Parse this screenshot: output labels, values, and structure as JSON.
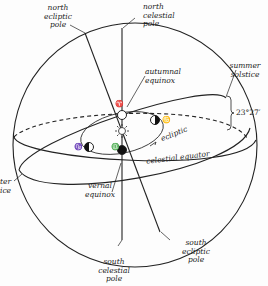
{
  "labels": {
    "north_ecliptic_pole": "north\necliptic\npole",
    "north_celestial_pole": "north\ncelestial\npole",
    "autumnal_equinox": "autumnal\nequinox",
    "summer_solstice": "summer\nsolstice",
    "obliquity": "23°27′",
    "ecliptic": "ecliptic",
    "celestial_equator": "celestial equator",
    "winter_solstice": "ter\nice",
    "vernal_equinox": "vernal\nequinox",
    "south_celestial_pole": "south\ncelestial\npole",
    "south_ecliptic_pole": "south\necliptic\npole"
  },
  "symbols": {
    "aries": "♈",
    "cancer": "♋",
    "capricorn": "♑",
    "libra": "♎"
  },
  "colors": {
    "line": "#222222",
    "background": "#fdfdfd"
  }
}
